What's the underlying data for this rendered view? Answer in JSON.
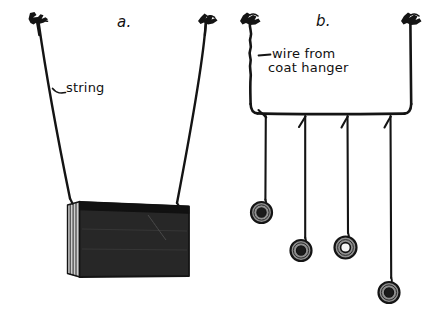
{
  "figure": {
    "background_color": "#ffffff",
    "ink_color": "#141414",
    "washer_body_color": "#8a8a8a",
    "book_cover_color": "#262626",
    "book_page_color": "#d8d8d8",
    "width": 443,
    "height": 317
  },
  "panels": [
    {
      "id": "a",
      "letter": "a.",
      "description": "Book suspended from two strings attached to hooks",
      "annotations": [
        {
          "id": "string",
          "text": "string"
        }
      ],
      "objects": {
        "hooks": 2,
        "strings": 2,
        "book": {
          "label": "book",
          "visible_page_edges": 4
        }
      }
    },
    {
      "id": "b",
      "letter": "b.",
      "description": "Coat hanger wire crossbar with four hanging washers",
      "annotations": [
        {
          "id": "wire-label-line-1",
          "text": "wire from"
        },
        {
          "id": "wire-label-line-2",
          "text": "coat hanger"
        }
      ],
      "objects": {
        "hooks": 2,
        "wire_frame": 1,
        "hanging_strings": 4,
        "washers": 4,
        "washer_drop_order": [
          1,
          2,
          3,
          4
        ]
      }
    }
  ],
  "labels": {
    "panel_a_letter": "a.",
    "panel_b_letter": "b.",
    "string_label": "string",
    "wire_label_line_1": "wire from",
    "wire_label_line_2": "coat hanger"
  }
}
